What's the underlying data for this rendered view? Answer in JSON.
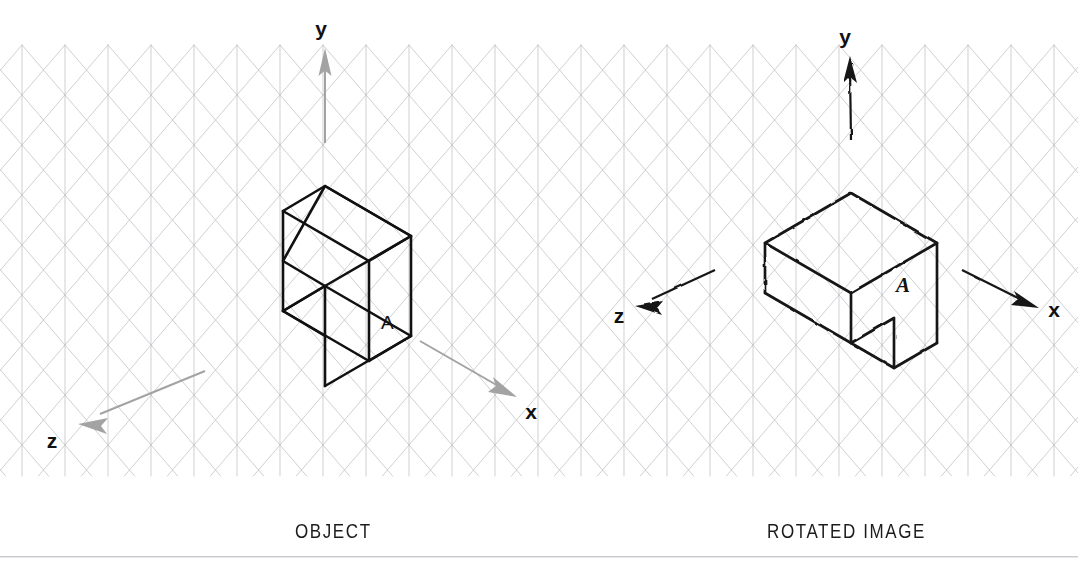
{
  "page": {
    "background_color": "#ffffff",
    "width": 1078,
    "height": 575
  },
  "captions": {
    "left": "OBJECT",
    "right": "ROTATED IMAGE"
  },
  "grid": {
    "type": "isometric-triangular",
    "color": "#b9bcc0",
    "line_width": 0.7,
    "vertical_spacing": 43,
    "row_height": 25,
    "origin_x": 22,
    "origin_y": 45,
    "columns": 25,
    "rows": 18
  },
  "left_panel": {
    "name": "object",
    "style": "cad-precise",
    "stroke_color": "#111111",
    "stroke_width": 2.6,
    "axes": {
      "color": "#9a9a9a",
      "items": [
        {
          "label": "y",
          "direction": "up",
          "label_x": 321,
          "label_y": 36
        },
        {
          "label": "x",
          "direction": "down-right",
          "label_x": 531,
          "label_y": 419
        },
        {
          "label": "z",
          "direction": "down-left",
          "label_x": 52,
          "label_y": 448
        }
      ]
    },
    "face_label": {
      "text": "A",
      "x": 381,
      "y": 329
    }
  },
  "right_panel": {
    "name": "rotated-image",
    "style": "hand-drawn",
    "stroke_color": "#151515",
    "stroke_width": 2.8,
    "axes": {
      "color": "#111111",
      "items": [
        {
          "label": "y",
          "direction": "up",
          "label_x": 845,
          "label_y": 44
        },
        {
          "label": "x",
          "direction": "down-right",
          "label_x": 1054,
          "label_y": 317
        },
        {
          "label": "z",
          "direction": "down-left",
          "label_x": 619,
          "label_y": 323
        }
      ]
    },
    "face_label": {
      "text": "A",
      "x": 903,
      "y": 292
    }
  },
  "chart_data": {
    "type": "diagram",
    "axes": [
      "x",
      "y",
      "z"
    ]
  }
}
